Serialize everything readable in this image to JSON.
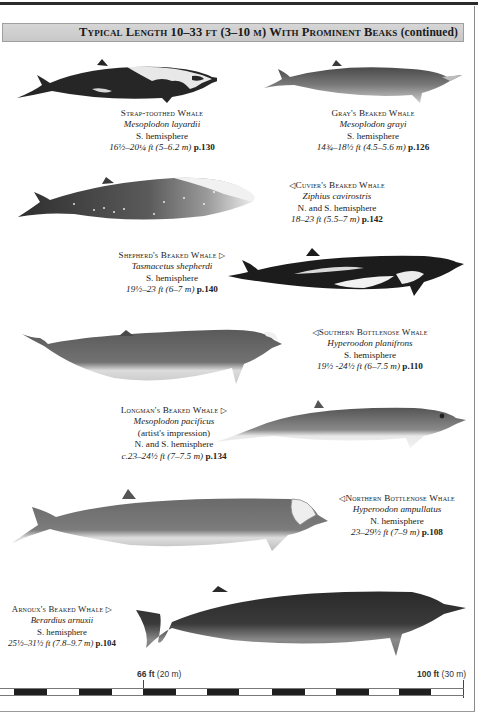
{
  "page": {
    "header": {
      "title": "Typical Length 10–33 ft (3–10 m) With Prominent Beaks",
      "suffix": "(continued)"
    },
    "species": [
      {
        "common_name": "Strap-toothed Whale",
        "arrow": "",
        "scientific_name": "Mesoplodon layardii",
        "range": "S. hemisphere",
        "size": "16½–20¼ ft (5–6.2 m)",
        "page_ref": "p.130",
        "illustration": "strap-toothed-whale"
      },
      {
        "common_name": "Gray's Beaked Whale",
        "arrow": "",
        "scientific_name": "Mesoplodon grayi",
        "range": "S. hemisphere",
        "size": "14¾–18½ ft (4.5–5.6 m)",
        "page_ref": "p.126",
        "illustration": "grays-beaked-whale"
      },
      {
        "common_name": "Cuvier's Beaked Whale",
        "arrow": "◁",
        "scientific_name": "Ziphius cavirostris",
        "range": "N. and S. hemisphere",
        "size": "18–23 ft (5.5–7 m)",
        "page_ref": "p.142",
        "illustration": "cuviers-beaked-whale"
      },
      {
        "common_name": "Shepherd's Beaked Whale",
        "arrow": "▷",
        "scientific_name": "Tasmacetus shepherdi",
        "range": "S. hemisphere",
        "size": "19½–23 ft (6–7 m)",
        "page_ref": "p.140",
        "illustration": "shepherds-beaked-whale"
      },
      {
        "common_name": "Southern Bottlenose Whale",
        "arrow": "◁",
        "scientific_name": "Hyperoodon planifrons",
        "range": "S. hemisphere",
        "size": "19½ -24½ ft (6–7.5 m)",
        "page_ref": "p.110",
        "illustration": "southern-bottlenose-whale"
      },
      {
        "common_name": "Longman's Beaked Whale",
        "arrow": "▷",
        "scientific_name": "Mesoplodon pacificus",
        "note": "(artist's impression)",
        "range": "N. and S. hemisphere",
        "size": "c.23–24½ ft (7–7.5 m)",
        "page_ref": "p.134",
        "illustration": "longmans-beaked-whale"
      },
      {
        "common_name": "Northern Bottlenose Whale",
        "arrow": "◁",
        "scientific_name": "Hyperoodon ampullatus",
        "range": "N. hemisphere",
        "size": "23–29½ ft (7–9 m)",
        "page_ref": "p.108",
        "illustration": "northern-bottlenose-whale"
      },
      {
        "common_name": "Arnoux's Beaked Whale",
        "arrow": "▷",
        "scientific_name": "Berardius arnuxii",
        "range": "S. hemisphere",
        "size": "25½–31½ ft (7.8–9.7 m)",
        "page_ref": "p.104",
        "illustration": "arnouxs-beaked-whale"
      }
    ],
    "scale_bar": {
      "mark_1": {
        "bold": "66 ft",
        "plain": "(20 m)"
      },
      "mark_2": {
        "bold": "100 ft",
        "plain": "(30 m)"
      }
    },
    "colors": {
      "header_band": "#cdcdcd",
      "whale_dark": "#2a2a2a",
      "whale_mid": "#6e6e6e",
      "whale_light": "#d8d8d8"
    }
  }
}
